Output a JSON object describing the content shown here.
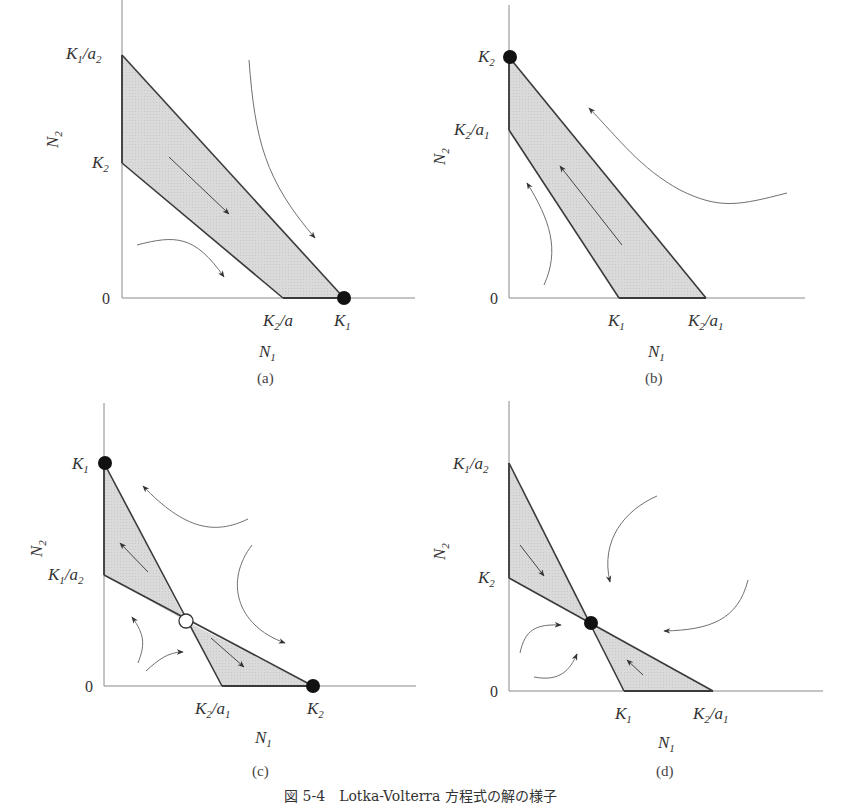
{
  "figure": {
    "caption": "図 5-4　Lotka-Volterra 方程式の解の様子"
  },
  "panels": [
    {
      "id": "a",
      "label": "(a)",
      "x_axis": "N1",
      "y_axis": "N2",
      "origin": "0",
      "y_ticks": [
        "K1/a2",
        "K2"
      ],
      "x_ticks": [
        "K2/a",
        "K1"
      ],
      "stable_points": [
        "K1 on N1 axis"
      ],
      "unstable_points": []
    },
    {
      "id": "b",
      "label": "(b)",
      "x_axis": "N1",
      "y_axis": "N2",
      "origin": "0",
      "y_ticks": [
        "K2",
        "K2/a1"
      ],
      "x_ticks": [
        "K1",
        "K2/a1"
      ],
      "stable_points": [
        "K2 on N2 axis"
      ],
      "unstable_points": []
    },
    {
      "id": "c",
      "label": "(c)",
      "x_axis": "N1",
      "y_axis": "N2",
      "origin": "0",
      "y_ticks": [
        "K1",
        "K1/a2"
      ],
      "x_ticks": [
        "K2/a1",
        "K2"
      ],
      "stable_points": [
        "K1 on N2 axis",
        "K2 on N1 axis"
      ],
      "unstable_points": [
        "interior crossing (saddle)"
      ]
    },
    {
      "id": "d",
      "label": "(d)",
      "x_axis": "N1",
      "y_axis": "N2",
      "origin": "0",
      "y_ticks": [
        "K1/a2",
        "K2"
      ],
      "x_ticks": [
        "K1",
        "K2/a1"
      ],
      "stable_points": [
        "interior crossing (stable node)"
      ],
      "unstable_points": []
    }
  ],
  "colors": {
    "axis": "#8a8a8a",
    "isocline": "#3a3a3a",
    "fill": "#d9d9d9",
    "trajectory": "#707070",
    "point": "#111111"
  }
}
